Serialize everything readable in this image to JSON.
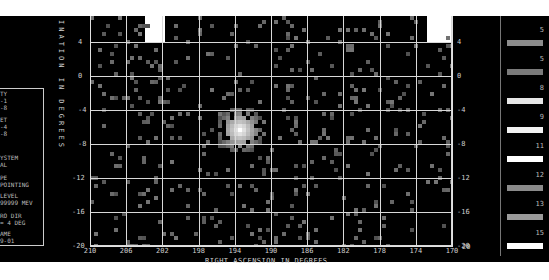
{
  "chart_data": {
    "type": "heatmap",
    "title": "",
    "xlabel": "RIGHT ASCENSION IN DEGREES",
    "ylabel": "DECLINATION IN DEGREES",
    "x_ticks": [
      "210",
      "206",
      "202",
      "198",
      "194",
      "190",
      "186",
      "182",
      "178",
      "174",
      "170"
    ],
    "y_ticks": [
      "4",
      "0",
      "-4",
      "-8",
      "-12",
      "-16",
      "-20"
    ],
    "xlim": [
      210,
      170
    ],
    "ylim": [
      -20,
      7
    ],
    "grid": true,
    "source_peak": {
      "ra": 193.5,
      "dec": -6,
      "intensity": "max"
    },
    "legend_levels": [
      {
        "label": "5",
        "shade": "#8c8c8c"
      },
      {
        "label": "5",
        "shade": "#7a7a7a"
      },
      {
        "label": "8",
        "shade": "#e6e6e6"
      },
      {
        "label": "9",
        "shade": "#f2f2f2"
      },
      {
        "label": "11",
        "shade": "#ffffff"
      },
      {
        "label": "12",
        "shade": "#8a8a8a"
      },
      {
        "label": "13",
        "shade": "#9a9a9a"
      },
      {
        "label": "15",
        "shade": "#ffffff"
      }
    ]
  },
  "axes": {
    "x_title": "RIGHT ASCENSION IN DEGREES",
    "y_title": "DECLINATION IN DEGREES",
    "y_title_visible": "INATION IN DEGREES",
    "x_ticks": [
      "210",
      "206",
      "202",
      "198",
      "194",
      "190",
      "186",
      "182",
      "178",
      "174",
      "170"
    ],
    "y_ticks_left": [
      "4",
      "0",
      "-4",
      "-8",
      "-12",
      "-16",
      "-20"
    ],
    "y_ticks_right": [
      "4",
      "0",
      "-4",
      "-8",
      "-12",
      "-16",
      "-20"
    ],
    "corner_right": "20"
  },
  "info_panel": {
    "lines": [
      "TY",
      "-1",
      "-8",
      "ET",
      "-4",
      "-8",
      "YSTEM",
      "AL",
      "PE",
      "POINTING",
      "LEVEL",
      "99999 MEV",
      "RO DIR",
      "= 4 DEG",
      "AME",
      "9-01"
    ]
  },
  "legend": {
    "labels": [
      "5",
      "5",
      "8",
      "9",
      "11",
      "12",
      "13",
      "15"
    ]
  }
}
